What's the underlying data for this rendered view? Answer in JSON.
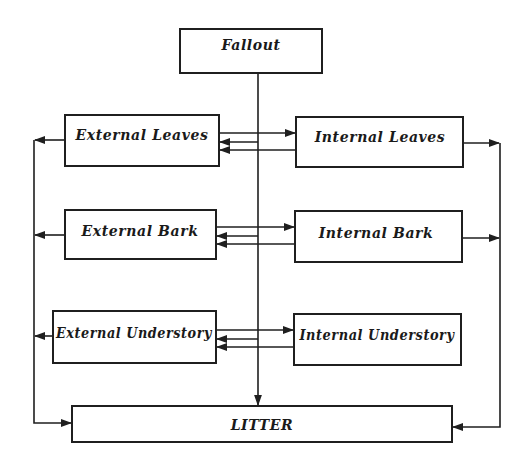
{
  "diagram": {
    "colors": {
      "line": "#1f1f1f",
      "text": "#1a1a1a",
      "box_fill": "#ffffff",
      "background": "#ffffff"
    },
    "nodes": [
      {
        "id": "fallout",
        "label": "Fallout",
        "x": 180,
        "y": 29,
        "w": 142,
        "h": 44,
        "label_y": 46
      },
      {
        "id": "ext_leaves",
        "label": "External Leaves",
        "x": 65,
        "y": 115,
        "w": 154,
        "h": 51,
        "label_y": 135
      },
      {
        "id": "int_leaves",
        "label": "Internal Leaves",
        "x": 296,
        "y": 117,
        "w": 167,
        "h": 50,
        "label_y": 137
      },
      {
        "id": "ext_bark",
        "label": "External Bark",
        "x": 65,
        "y": 210,
        "w": 151,
        "h": 49,
        "label_y": 231
      },
      {
        "id": "int_bark",
        "label": "Internal Bark",
        "x": 295,
        "y": 211,
        "w": 167,
        "h": 51,
        "label_y": 233
      },
      {
        "id": "ext_understory",
        "label": "External Understory",
        "x": 53,
        "y": 311,
        "w": 163,
        "h": 52,
        "label_y": 333
      },
      {
        "id": "int_understory",
        "label": "Internal Understory",
        "x": 294,
        "y": 314,
        "w": 167,
        "h": 51,
        "label_y": 335
      },
      {
        "id": "litter",
        "label": "LITTER",
        "x": 72,
        "y": 406,
        "w": 380,
        "h": 36,
        "label_y": 428
      }
    ],
    "edges": [
      {
        "from": "fallout",
        "to": "litter",
        "label": ""
      },
      {
        "from": "fallout",
        "to": "ext_leaves",
        "label": ""
      },
      {
        "from": "fallout",
        "to": "ext_bark",
        "label": ""
      },
      {
        "from": "fallout",
        "to": "ext_understory",
        "label": ""
      },
      {
        "from": "ext_leaves",
        "to": "int_leaves",
        "label": ""
      },
      {
        "from": "int_leaves",
        "to": "ext_leaves",
        "label": ""
      },
      {
        "from": "ext_bark",
        "to": "int_bark",
        "label": ""
      },
      {
        "from": "int_bark",
        "to": "ext_bark",
        "label": ""
      },
      {
        "from": "ext_understory",
        "to": "int_understory",
        "label": ""
      },
      {
        "from": "int_understory",
        "to": "ext_understory",
        "label": ""
      },
      {
        "from": "ext_leaves",
        "to": "litter",
        "label": ""
      },
      {
        "from": "ext_bark",
        "to": "litter",
        "label": ""
      },
      {
        "from": "ext_understory",
        "to": "litter",
        "label": ""
      },
      {
        "from": "int_leaves",
        "to": "litter",
        "label": ""
      },
      {
        "from": "int_bark",
        "to": "litter",
        "label": ""
      }
    ]
  }
}
